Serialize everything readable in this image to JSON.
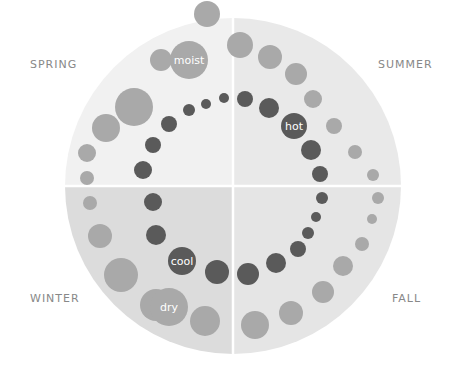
{
  "seasons": {
    "spring": "SPRING",
    "summer": "SUMMER",
    "winter": "WINTER",
    "fall": "FALL"
  },
  "qualities": {
    "moist": "moist",
    "hot": "hot",
    "cool": "cool",
    "dry": "dry"
  },
  "colors": {
    "spring_fill": "#f1f1f1",
    "summer_fill": "#e9e9e9",
    "winter_fill": "#dcdcdc",
    "fall_fill": "#e5e5e5",
    "outer_dot": "#a9a9a9",
    "inner_dot": "#5a5a5a",
    "label_text": "#888888"
  },
  "outer_dots": [
    [
      207,
      14,
      13
    ],
    [
      161,
      60,
      11
    ],
    [
      134,
      107,
      19
    ],
    [
      106,
      128,
      14
    ],
    [
      87,
      153,
      9
    ],
    [
      87,
      178,
      7
    ],
    [
      240,
      45,
      13
    ],
    [
      270,
      57,
      12
    ],
    [
      296,
      74,
      11
    ],
    [
      313,
      99,
      9
    ],
    [
      334,
      126,
      8
    ],
    [
      355,
      152,
      7
    ],
    [
      373,
      175,
      6
    ],
    [
      90,
      203,
      7
    ],
    [
      100,
      236,
      12
    ],
    [
      121,
      275,
      17
    ],
    [
      156,
      305,
      16
    ],
    [
      205,
      321,
      15
    ],
    [
      378,
      198,
      6
    ],
    [
      372,
      219,
      5
    ],
    [
      362,
      244,
      7
    ],
    [
      343,
      266,
      10
    ],
    [
      323,
      292,
      11
    ],
    [
      291,
      313,
      12
    ],
    [
      255,
      325,
      14
    ]
  ],
  "inner_dots": [
    [
      224,
      98,
      5
    ],
    [
      206,
      104,
      5
    ],
    [
      189,
      110,
      6
    ],
    [
      169,
      124,
      8
    ],
    [
      153,
      145,
      8
    ],
    [
      143,
      170,
      9
    ],
    [
      245,
      99,
      8
    ],
    [
      269,
      108,
      10
    ],
    [
      294,
      126,
      12
    ],
    [
      311,
      150,
      10
    ],
    [
      320,
      174,
      8
    ],
    [
      153,
      202,
      9
    ],
    [
      156,
      235,
      10
    ],
    [
      182,
      262,
      12
    ],
    [
      217,
      272,
      12
    ],
    [
      322,
      198,
      6
    ],
    [
      316,
      217,
      5
    ],
    [
      308,
      233,
      6
    ],
    [
      298,
      249,
      8
    ],
    [
      276,
      263,
      10
    ],
    [
      248,
      274,
      11
    ]
  ],
  "quality_dots": {
    "moist": [
      189,
      60,
      19
    ],
    "hot": [
      294,
      126,
      13
    ],
    "cool": [
      182,
      261,
      14
    ],
    "dry": [
      169,
      307,
      19
    ]
  }
}
